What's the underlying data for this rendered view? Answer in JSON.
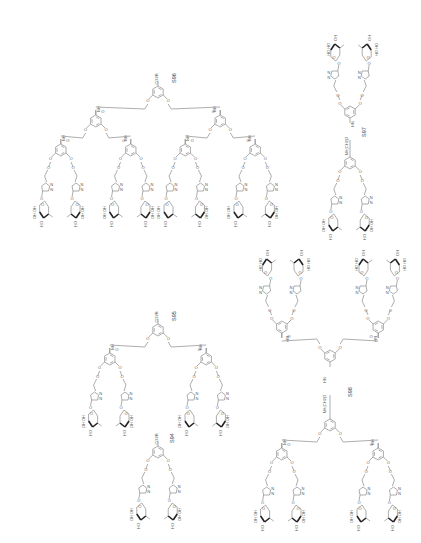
{
  "figure": {
    "compounds": [
      {
        "id": "S94",
        "label": "S94",
        "core_group": "CO2R",
        "generation": 1,
        "sugar_units": 2
      },
      {
        "id": "S95",
        "label": "S95",
        "core_group": "CO2R",
        "generation": 2,
        "sugar_units": 4
      },
      {
        "id": "S96",
        "label": "S96",
        "core_group": "CO2R",
        "generation": 3,
        "sugar_units": 8
      },
      {
        "id": "S97",
        "label": "S97",
        "linker_group": "NH(CH2)3",
        "generation": 1,
        "sugar_units": 4
      },
      {
        "id": "S98",
        "label": "S98",
        "linker_group": "NH(CH2)3",
        "generation": 2,
        "sugar_units": 8
      }
    ],
    "atom_labels": {
      "oxygen": "O",
      "amide": "NH",
      "hydroxyl": "OH",
      "hydroxyl_rev": "HO",
      "triazole_n": "N",
      "triazole_nn": "N=N",
      "ester": "CO2R",
      "linker": "NH(CH2)3",
      "amide_rev": "HN"
    }
  }
}
